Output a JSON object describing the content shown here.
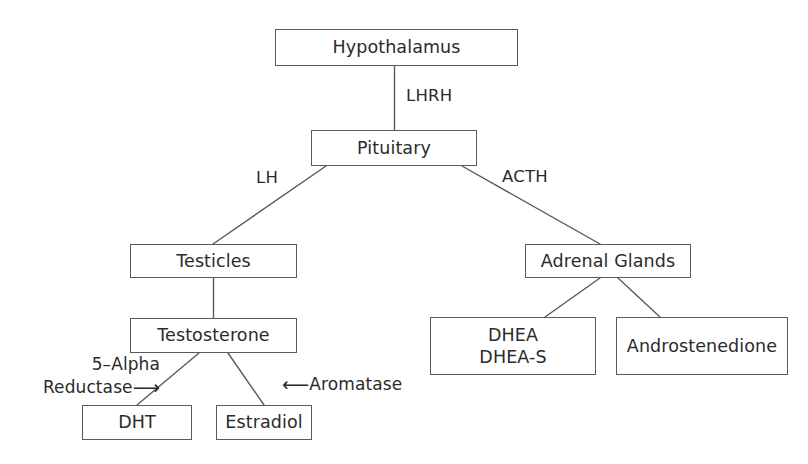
{
  "diagram": {
    "background_color": "#ffffff",
    "line_color": "#5a5a5a",
    "text_color": "#2b2b2b",
    "nodes": [
      {
        "id": "hypothalamus",
        "label": "Hypothalamus"
      },
      {
        "id": "pituitary",
        "label": "Pituitary"
      },
      {
        "id": "testicles",
        "label": "Testicles"
      },
      {
        "id": "adrenal_glands",
        "label": "Adrenal Glands"
      },
      {
        "id": "testosterone",
        "label": "Testosterone"
      },
      {
        "id": "dhea_line1",
        "label": "DHEA"
      },
      {
        "id": "dhea_line2",
        "label": "DHEA-S"
      },
      {
        "id": "androstenedione",
        "label": "Androstenedione"
      },
      {
        "id": "dht",
        "label": "DHT"
      },
      {
        "id": "estradiol",
        "label": "Estradiol"
      }
    ],
    "edge_labels": [
      {
        "id": "lhrh",
        "label": "LHRH",
        "from": "hypothalamus",
        "to": "pituitary"
      },
      {
        "id": "lh",
        "label": "LH",
        "from": "pituitary",
        "to": "testicles"
      },
      {
        "id": "acth",
        "label": "ACTH",
        "from": "pituitary",
        "to": "adrenal_glands"
      }
    ],
    "enzyme_labels": [
      {
        "id": "five_alpha_reductase",
        "line1": "5–Alpha",
        "line2": "Reductase",
        "arrow": "⟶",
        "points_to": "dht"
      },
      {
        "id": "aromatase",
        "arrow": "⟵",
        "text": "Aromatase",
        "points_to": "estradiol"
      }
    ]
  }
}
